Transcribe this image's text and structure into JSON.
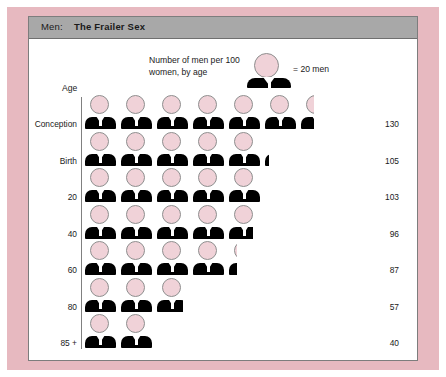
{
  "header": {
    "prefix": "Men:",
    "title": "The Frailer Sex"
  },
  "legend": {
    "description": "Number of men per 100 women, by age",
    "equals_label": "= 20 men",
    "icon": "man-figure-icon",
    "unit_value": 20
  },
  "axis": {
    "age_caption": "Age"
  },
  "chart_data": {
    "type": "bar",
    "subtype": "pictogram",
    "title": "Men: The Frailer Sex",
    "xlabel": "",
    "ylabel": "Age",
    "unit_label": "= 20 men",
    "unit_value": 20,
    "legend_note": "Number of men per 100 women, by age",
    "categories": [
      "Conception",
      "Birth",
      "20",
      "40",
      "60",
      "80",
      "85 +"
    ],
    "values": [
      130,
      105,
      103,
      96,
      87,
      57,
      40
    ],
    "value_labels": [
      "130",
      "105",
      "103",
      "96",
      "87",
      "57",
      "40"
    ],
    "icons_per_row": [
      6.5,
      5.25,
      5.15,
      4.8,
      4.35,
      2.85,
      2.0
    ],
    "xlim": [
      0,
      140
    ],
    "grid": false,
    "legend_position": "top"
  },
  "colors": {
    "frame": "#e7b9c0",
    "header_bar": "#a8a8a8",
    "head_fill": "#f0d2d8",
    "body_fill": "#000000",
    "card_bg": "#ffffff",
    "text": "#1a1a1a"
  }
}
